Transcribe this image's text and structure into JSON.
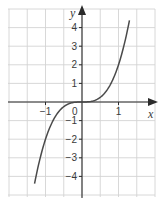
{
  "chart_data": {
    "type": "line",
    "title": "",
    "function": "y = 2x^3",
    "xlabel": "x",
    "ylabel": "y",
    "origin_label": "0",
    "xlim": [
      -2.0,
      2.0
    ],
    "ylim": [
      -5.0,
      5.0
    ],
    "x_ticks": [
      {
        "value": -1,
        "label": "−1"
      },
      {
        "value": 1,
        "label": "1"
      }
    ],
    "y_ticks": [
      {
        "value": 4,
        "label": "4"
      },
      {
        "value": 3,
        "label": "3"
      },
      {
        "value": 2,
        "label": "2"
      },
      {
        "value": 1,
        "label": "1"
      },
      {
        "value": -1,
        "label": "−1"
      },
      {
        "value": -2,
        "label": "−2"
      },
      {
        "value": -3,
        "label": "−3"
      },
      {
        "value": -4,
        "label": "−4"
      }
    ],
    "grid": true,
    "grid_x_step": 0.5,
    "grid_y_step": 1,
    "series": [
      {
        "name": "curve",
        "x": [
          -1.3,
          -1.2,
          -1.1,
          -1.0,
          -0.9,
          -0.8,
          -0.7,
          -0.6,
          -0.5,
          -0.4,
          -0.3,
          -0.2,
          -0.1,
          0,
          0.1,
          0.2,
          0.3,
          0.4,
          0.5,
          0.6,
          0.7,
          0.8,
          0.9,
          1.0,
          1.1,
          1.2,
          1.3
        ],
        "y": [
          -4.39,
          -3.46,
          -2.66,
          -2.0,
          -1.46,
          -1.02,
          -0.69,
          -0.43,
          -0.25,
          -0.13,
          -0.05,
          -0.02,
          0.0,
          0,
          0.0,
          0.02,
          0.05,
          0.13,
          0.25,
          0.43,
          0.69,
          1.02,
          1.46,
          2.0,
          2.66,
          3.46,
          4.39
        ],
        "color": "#4a4a4a"
      }
    ]
  }
}
